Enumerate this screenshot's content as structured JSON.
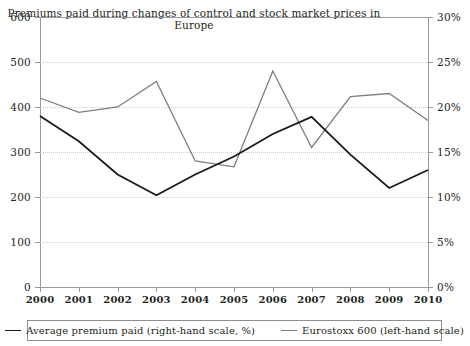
{
  "chart_data": {
    "type": "line",
    "title": "Premiums paid during changes of control and stock market prices in Europe",
    "xlabel": "",
    "ylabel": "",
    "grid": true,
    "legend_position": "bottom",
    "categories": [
      "2000",
      "2001",
      "2002",
      "2003",
      "2004",
      "2005",
      "2006",
      "2007",
      "2008",
      "2009",
      "2010"
    ],
    "x_tick_labels": [
      "2000",
      "2001",
      "2002",
      "2003",
      "2004",
      "2005",
      "2006",
      "2007",
      "2008",
      "2009",
      "2010"
    ],
    "left_axis": {
      "label": "",
      "ylim": [
        0,
        600
      ],
      "ticks": [
        0,
        100,
        200,
        300,
        400,
        500,
        600
      ],
      "tick_labels": [
        "0",
        "100",
        "200",
        "300",
        "400",
        "500",
        "600"
      ]
    },
    "right_axis": {
      "label": "",
      "ylim": [
        0,
        30
      ],
      "ticks": [
        0,
        5,
        10,
        15,
        20,
        25,
        30
      ],
      "tick_labels": [
        "0%",
        "5%",
        "10%",
        "15%",
        "20%",
        "25%",
        "30%"
      ]
    },
    "series": [
      {
        "name": "Average premium paid (right-hand scale, %)",
        "axis": "right",
        "color": "#1a1a1a",
        "width": 1.8,
        "values": [
          19.0,
          16.2,
          12.5,
          10.2,
          12.5,
          14.5,
          17.0,
          18.9,
          14.7,
          11.0,
          13.0
        ]
      },
      {
        "name": "Eurostoxx 600 (left-hand scale)",
        "axis": "left",
        "color": "#7d7d7d",
        "width": 1.3,
        "values": [
          420,
          388,
          400,
          457,
          280,
          267,
          480,
          310,
          423,
          430,
          370
        ]
      }
    ]
  },
  "legend": {
    "items": [
      {
        "label": "Average premium paid (right-hand scale, %)",
        "swatch": "line-dark"
      },
      {
        "label": "Eurostoxx 600 (left-hand scale)",
        "swatch": "line-gray"
      }
    ]
  }
}
